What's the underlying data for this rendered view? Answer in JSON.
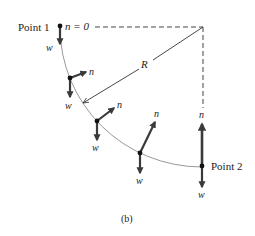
{
  "figure": {
    "caption": "(b)",
    "point1_label": "Point 1",
    "point2_label": "Point 2",
    "n_zero_label": "n = 0",
    "radius_label": "R",
    "normal_force_label": "n",
    "weight_label": "w"
  },
  "colors": {
    "arrow": "#3a3a3a",
    "arc": "#9a9a9a",
    "dashed": "#444444",
    "radius_line": "#333333",
    "text": "#222222"
  },
  "positions": [
    {
      "name": "point-1",
      "dot": [
        60,
        26
      ],
      "normal": null,
      "weight_end": [
        60,
        44
      ]
    },
    {
      "name": "position-2",
      "dot": [
        70,
        78
      ],
      "normal_end": [
        86,
        72
      ],
      "weight_end": [
        70,
        97
      ]
    },
    {
      "name": "position-3",
      "dot": [
        97,
        121
      ],
      "normal_end": [
        114,
        108
      ],
      "weight_end": [
        97,
        140
      ]
    },
    {
      "name": "position-4",
      "dot": [
        140,
        153
      ],
      "normal_end": [
        155,
        122
      ],
      "weight_end": [
        140,
        173
      ]
    },
    {
      "name": "point-2",
      "dot": [
        202,
        166
      ],
      "normal_end": [
        202,
        124
      ],
      "weight_end": [
        202,
        187
      ]
    }
  ]
}
